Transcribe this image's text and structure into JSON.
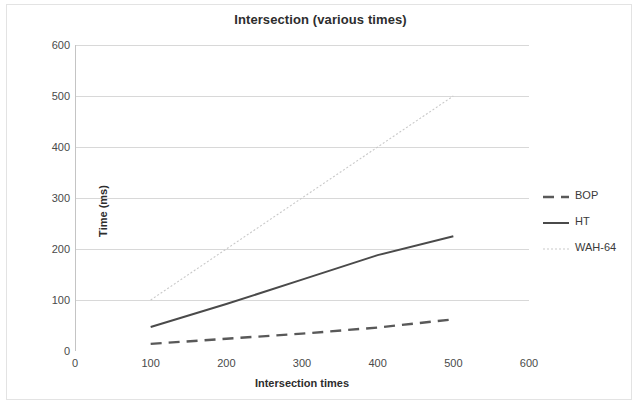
{
  "chart_data": {
    "type": "line",
    "title": "Intersection (various times)",
    "xlabel": "Intersection times",
    "ylabel": "Time (ms)",
    "xlim": [
      0,
      600
    ],
    "ylim": [
      0,
      600
    ],
    "xticks": [
      0,
      100,
      200,
      300,
      400,
      500,
      600
    ],
    "yticks": [
      0,
      100,
      200,
      300,
      400,
      500,
      600
    ],
    "grid": "horizontal",
    "legend_position": "right",
    "x": [
      100,
      200,
      300,
      400,
      500
    ],
    "series": [
      {
        "name": "BOP",
        "style": "dashed",
        "color": "#595959",
        "values": [
          14,
          24,
          34,
          46,
          62
        ]
      },
      {
        "name": "HT",
        "style": "solid",
        "color": "#4a4a4a",
        "values": [
          47,
          92,
          140,
          188,
          225
        ]
      },
      {
        "name": "WAH-64",
        "style": "dotted",
        "color": "#c9c9c9",
        "values": [
          100,
          200,
          300,
          400,
          500
        ]
      }
    ]
  },
  "legend": {
    "items": [
      {
        "label": "BOP"
      },
      {
        "label": "HT"
      },
      {
        "label": "WAH-64"
      }
    ]
  },
  "axes": {
    "y_tick_labels": [
      "600",
      "500",
      "400",
      "300",
      "200",
      "100",
      "0"
    ],
    "x_tick_labels": [
      "0",
      "100",
      "200",
      "300",
      "400",
      "500",
      "600"
    ]
  }
}
